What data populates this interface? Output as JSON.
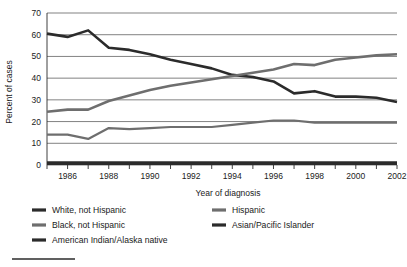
{
  "chart_data": {
    "type": "line",
    "title": "",
    "xlabel": "Year of diagnosis",
    "ylabel": "Percent of cases",
    "xlim": [
      1985,
      2002
    ],
    "ylim": [
      0,
      70
    ],
    "ytick_values": [
      0,
      10,
      20,
      30,
      40,
      50,
      60,
      70
    ],
    "ytick_labels": [
      "0",
      "10",
      "20",
      "30",
      "40",
      "50",
      "60",
      "70"
    ],
    "xtick_values": [
      1985,
      1986,
      1987,
      1988,
      1989,
      1990,
      1991,
      1992,
      1993,
      1994,
      1995,
      1996,
      1997,
      1998,
      1999,
      2000,
      2001,
      2002
    ],
    "xtick_labels": [
      "",
      "1986",
      "",
      "1988",
      "",
      "1990",
      "",
      "1992",
      "",
      "1994",
      "",
      "1996",
      "",
      "1998",
      "",
      "2000",
      "",
      "2002"
    ],
    "grid": "horizontal",
    "legend_position": "below",
    "x": [
      1985,
      1986,
      1987,
      1988,
      1989,
      1990,
      1991,
      1992,
      1993,
      1994,
      1995,
      1996,
      1997,
      1998,
      1999,
      2000,
      2001,
      2002
    ],
    "series": [
      {
        "name": "White, not Hispanic",
        "color": "#2b2b2b",
        "width": 2.6,
        "values": [
          60.5,
          59.0,
          62.0,
          54.0,
          53.0,
          51.0,
          48.5,
          46.5,
          44.5,
          41.5,
          40.5,
          38.5,
          33.0,
          34.0,
          31.5,
          31.5,
          31.0,
          29.0
        ]
      },
      {
        "name": "Black, not Hispanic",
        "color": "#6e6e6e",
        "width": 2.6,
        "values": [
          24.5,
          25.5,
          25.5,
          29.5,
          32.0,
          34.5,
          36.5,
          38.0,
          39.5,
          41.0,
          42.5,
          44.0,
          46.5,
          46.0,
          48.5,
          49.5,
          50.5,
          51.0
        ]
      },
      {
        "name": "Hispanic",
        "color": "#6e6e6e",
        "width": 2.2,
        "values": [
          14.0,
          14.0,
          12.0,
          17.0,
          16.5,
          17.0,
          17.5,
          17.5,
          17.5,
          18.5,
          19.5,
          20.5,
          20.5,
          19.5,
          19.5,
          19.5,
          19.5,
          19.5
        ]
      },
      {
        "name": "Asian/Pacific Islander",
        "color": "#2b2b2b",
        "width": 2.2,
        "values": [
          1.2,
          1.2,
          1.2,
          1.2,
          1.2,
          1.2,
          1.2,
          1.2,
          1.2,
          1.2,
          1.2,
          1.2,
          1.2,
          1.2,
          1.2,
          1.2,
          1.2,
          1.2
        ]
      },
      {
        "name": "American Indian/Alaska native",
        "color": "#2b2b2b",
        "width": 2.2,
        "values": [
          0.5,
          0.5,
          0.5,
          0.5,
          0.5,
          0.5,
          0.5,
          0.5,
          0.5,
          0.5,
          0.5,
          0.5,
          0.5,
          0.5,
          0.5,
          0.5,
          0.5,
          0.5
        ]
      }
    ],
    "legend": [
      {
        "label": "White, not Hispanic",
        "color": "#2b2b2b"
      },
      {
        "label": "Hispanic",
        "color": "#6e6e6e"
      },
      {
        "label": "Black, not Hispanic",
        "color": "#6e6e6e"
      },
      {
        "label": "Asian/Pacific Islander",
        "color": "#2b2b2b"
      },
      {
        "label": "American Indian/Alaska native",
        "color": "#2b2b2b"
      }
    ]
  }
}
